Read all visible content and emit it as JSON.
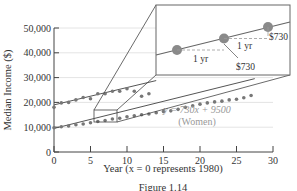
{
  "chart_data": {
    "type": "scatter",
    "title": "",
    "xlabel": "Year (x = 0 represents 1980)",
    "ylabel": "Median Income ($)",
    "xlim": [
      0,
      30
    ],
    "ylim": [
      0,
      50000
    ],
    "x_ticks": [
      0,
      5,
      10,
      15,
      20,
      25,
      30
    ],
    "y_ticks": [
      0,
      10000,
      20000,
      30000,
      40000,
      50000
    ],
    "y_tick_labels": [
      "0",
      "10,000",
      "20,000",
      "30,000",
      "40,000",
      "50,000"
    ],
    "grid": "horizontal",
    "series": [
      {
        "name": "Men",
        "type": "scatter+line",
        "x": [
          0,
          1,
          2,
          3,
          4,
          5,
          6,
          7,
          8,
          9,
          10,
          11,
          12,
          13
        ],
        "y": [
          18000,
          19800,
          20000,
          21000,
          22000,
          21500,
          23500,
          23500,
          24500,
          24500,
          25500,
          24500,
          22500,
          23500
        ],
        "trend": {
          "slope": 700,
          "intercept": 19000
        }
      },
      {
        "name": "Women",
        "type": "scatter+line",
        "x": [
          0,
          1,
          2,
          3,
          4,
          5,
          6,
          7,
          8,
          9,
          10,
          11,
          12,
          13,
          14,
          15,
          16,
          17,
          18,
          19,
          20,
          21,
          22,
          23,
          24,
          25,
          26,
          27
        ],
        "y": [
          9800,
          10200,
          10500,
          11000,
          11300,
          11800,
          12300,
          12700,
          13300,
          13600,
          14200,
          14600,
          15000,
          15300,
          15800,
          16300,
          16600,
          17200,
          18000,
          18600,
          19300,
          19800,
          20200,
          20500,
          21000,
          21300,
          21900,
          22800
        ],
        "trend": {
          "slope": 730,
          "intercept": 9500,
          "label": "y = 730x + 9500",
          "sublabel": "(Women)"
        }
      }
    ],
    "annotations": {
      "inset_label_1": "1 yr",
      "inset_label_2": "1 yr",
      "inset_value_1": "$730",
      "inset_value_2": "$730"
    }
  },
  "labels": {
    "equation": "y = 730x + 9500",
    "equation_sub": "(Women)",
    "one_yr_a": "1 yr",
    "one_yr_b": "1 yr",
    "val_a": "$730",
    "val_b": "$730",
    "caption": "Figure 1.14"
  }
}
